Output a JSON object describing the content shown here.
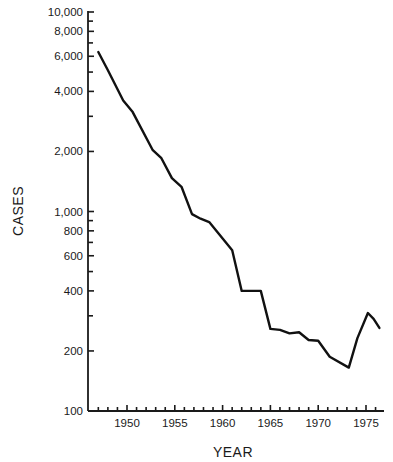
{
  "chart_data": {
    "type": "line",
    "title": "",
    "xlabel": "YEAR",
    "ylabel": "CASES",
    "yscale": "log",
    "ylim": [
      100,
      10000
    ],
    "xlim": [
      1946.2,
      1976.5
    ],
    "grid": false,
    "legend": null,
    "x_tick_labels": [
      "1950",
      "1955",
      "1960",
      "1965",
      "1970",
      "1975"
    ],
    "x_ticks": [
      1950,
      1955,
      1960,
      1965,
      1970,
      1975
    ],
    "x_minor_ticks_every": 1,
    "y_tick_labels": [
      "100",
      "200",
      "400",
      "600",
      "800",
      "1,000",
      "2,000",
      "4,000",
      "6,000",
      "8,000",
      "10,000"
    ],
    "y_ticks": [
      100,
      200,
      400,
      600,
      800,
      1000,
      2000,
      4000,
      6000,
      8000,
      10000
    ],
    "y_minor_ticks": [
      300,
      500,
      700,
      900,
      3000,
      5000,
      7000,
      9000
    ],
    "series": [
      {
        "name": "Cases",
        "color": "#111111",
        "x": [
          1947,
          1948,
          1949.6,
          1950.6,
          1952.7,
          1953.6,
          1954.7,
          1955.7,
          1956.8,
          1957.7,
          1958.6,
          1961,
          1962,
          1964,
          1965,
          1966,
          1967,
          1968,
          1969,
          1970,
          1971.2,
          1973.2,
          1974.1,
          1975.2,
          1975.8,
          1976.4
        ],
        "values": [
          6300,
          5100,
          3600,
          3150,
          2030,
          1850,
          1470,
          1330,
          970,
          920,
          885,
          640,
          400,
          400,
          258,
          255,
          245,
          248,
          227,
          225,
          187,
          165,
          232,
          310,
          290,
          261
        ]
      }
    ]
  }
}
